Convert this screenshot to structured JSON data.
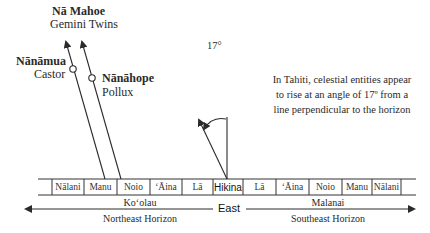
{
  "title": {
    "group_name": "Nā Mahoe",
    "group_english": "Gemini Twins"
  },
  "stars": [
    {
      "name": "Nānāmua",
      "english": "Castor"
    },
    {
      "name": "Nānāhope",
      "english": "Pollux"
    }
  ],
  "angle_label": "17°",
  "note": "In Tahiti, celestial entities appear to rise at an angle of 17º from a line perpendicular to the horizon",
  "horizon_cells": [
    "Nālani",
    "Manu",
    "Noio",
    "ʻĀina",
    "Lā",
    "Hikina",
    "Lā",
    "ʻĀina",
    "Noio",
    "Manu",
    "Nālani"
  ],
  "center_label": "East",
  "left_direction": {
    "name": "Koʻolau",
    "description": "Northeast Horizon"
  },
  "right_direction": {
    "name": "Malanai",
    "description": "Southeast Horizon"
  },
  "colors": {
    "line": "#2a2a2a",
    "text": "#2a2a2a"
  }
}
